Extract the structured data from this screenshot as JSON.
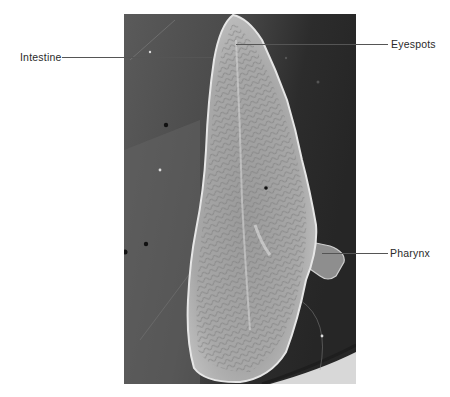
{
  "figure": {
    "labels": [
      {
        "id": "intestine",
        "text": "Intestine",
        "side": "left"
      },
      {
        "id": "eyespots",
        "text": "Eyespots",
        "side": "right"
      },
      {
        "id": "pharynx",
        "text": "Pharynx",
        "side": "right"
      }
    ]
  },
  "colors": {
    "background": "#ffffff",
    "label_text": "#2a2a2a",
    "leader_line": "#555555",
    "photo_bg_dark": "#2b2b2b",
    "photo_bg_mid": "#5e5e5e",
    "worm_body": "#bdbdbd"
  }
}
